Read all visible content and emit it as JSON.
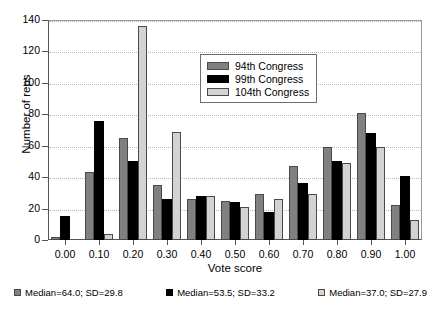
{
  "chart_data": {
    "type": "bar",
    "title": "",
    "xlabel": "Vote score",
    "ylabel": "Number of reps",
    "categories": [
      "0.00",
      "0.10",
      "0.20",
      "0.30",
      "0.40",
      "0.50",
      "0.60",
      "0.70",
      "0.80",
      "0.90",
      "1.00"
    ],
    "series": [
      {
        "name": "94th Congress",
        "color": "#808080",
        "values": [
          2,
          43,
          65,
          35,
          26,
          25,
          29,
          47,
          59,
          81,
          22
        ]
      },
      {
        "name": "99th Congress",
        "color": "#000000",
        "values": [
          15,
          76,
          50,
          26,
          28,
          24,
          18,
          36,
          50,
          68,
          41
        ]
      },
      {
        "name": "104th Congress",
        "color": "#d3d3d3",
        "values": [
          0,
          4,
          136,
          69,
          28,
          21,
          26,
          29,
          49,
          59,
          13
        ]
      }
    ],
    "ylim": [
      0,
      140
    ],
    "yticks": [
      0,
      20,
      40,
      60,
      80,
      100,
      120,
      140
    ],
    "grid": true,
    "legend_position": "upper center"
  },
  "legend": {
    "items": [
      {
        "label": "94th Congress"
      },
      {
        "label": "99th Congress"
      },
      {
        "label": "104th Congress"
      }
    ]
  },
  "footer_stats": [
    {
      "label": "Median=64.0; SD=29.8"
    },
    {
      "label": "Median=53.5; SD=33.2"
    },
    {
      "label": "Median=37.0; SD=27.9"
    }
  ]
}
